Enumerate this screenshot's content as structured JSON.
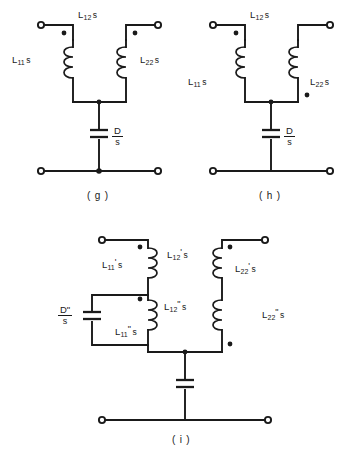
{
  "figure": {
    "background_color": "#ffffff",
    "ink_color": "#1a1a1a",
    "width": 355,
    "height": 452
  },
  "circuits": [
    {
      "id": "g",
      "caption": "( g )",
      "labels": {
        "left_inductor": {
          "base": "L",
          "sub": "11",
          "prime": "",
          "suffix": "s"
        },
        "mutual_inductor": {
          "base": "L",
          "sub": "12",
          "prime": "",
          "suffix": "s"
        },
        "right_inductor": {
          "base": "L",
          "sub": "22",
          "prime": "",
          "suffix": "s"
        },
        "capacitor_numerator": "D",
        "capacitor_denominator": "s"
      },
      "dots": {
        "left_coil": "top-left",
        "right_coil": "top-left"
      },
      "bottom_junction_dot": true
    },
    {
      "id": "h",
      "caption": "( h )",
      "labels": {
        "left_inductor": {
          "base": "L",
          "sub": "11",
          "prime": "",
          "suffix": "s"
        },
        "mutual_inductor": {
          "base": "L",
          "sub": "12",
          "prime": "",
          "suffix": "s"
        },
        "right_inductor": {
          "base": "L",
          "sub": "22",
          "prime": "",
          "suffix": "s"
        },
        "capacitor_numerator": "D",
        "capacitor_denominator": "s"
      },
      "dots": {
        "left_coil": "top-left",
        "right_coil": "bottom-right"
      },
      "bottom_junction_dot": false
    },
    {
      "id": "i",
      "caption": "( i )",
      "labels": {
        "left_upper_inductor": {
          "base": "L",
          "sub": "11",
          "prime": "'",
          "suffix": "s"
        },
        "left_lower_inductor": {
          "base": "L",
          "sub": "11",
          "prime": "\"",
          "suffix": "s"
        },
        "mutual_upper": {
          "base": "L",
          "sub": "12",
          "prime": "'",
          "suffix": "s"
        },
        "mutual_lower": {
          "base": "L",
          "sub": "12",
          "prime": "\"",
          "suffix": "s"
        },
        "right_upper_inductor": {
          "base": "L",
          "sub": "22",
          "prime": "'",
          "suffix": "s"
        },
        "right_lower_inductor": {
          "base": "L",
          "sub": "22",
          "prime": "\"",
          "suffix": "s"
        },
        "series_capacitor_numerator": "D\"",
        "series_capacitor_denominator": "s"
      },
      "dots": {
        "left_upper_coil": "top-right",
        "left_lower_coil": "top-right",
        "right_upper_coil": "top-left",
        "right_lower_coil": "bottom-left"
      },
      "shunt_capacitor_label": ""
    }
  ]
}
